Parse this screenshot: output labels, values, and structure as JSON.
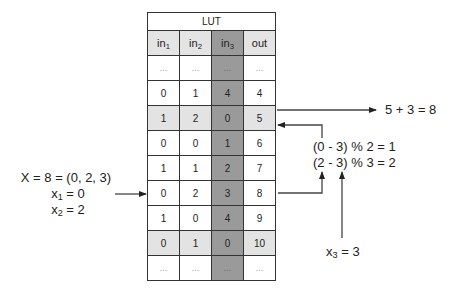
{
  "table": {
    "title": "LUT",
    "columns": [
      {
        "base": "in",
        "sub": "1"
      },
      {
        "base": "in",
        "sub": "2"
      },
      {
        "base": "in",
        "sub": "3"
      },
      {
        "base": "out",
        "sub": ""
      }
    ],
    "shaded_column_index": 2,
    "rows": [
      {
        "cells": [
          "...",
          "...",
          "...",
          "..."
        ],
        "highlight": false
      },
      {
        "cells": [
          "0",
          "1",
          "4",
          "4"
        ],
        "highlight": false
      },
      {
        "cells": [
          "1",
          "2",
          "0",
          "5"
        ],
        "highlight": true
      },
      {
        "cells": [
          "0",
          "0",
          "1",
          "6"
        ],
        "highlight": false
      },
      {
        "cells": [
          "1",
          "1",
          "2",
          "7"
        ],
        "highlight": false
      },
      {
        "cells": [
          "0",
          "2",
          "3",
          "8"
        ],
        "highlight": false
      },
      {
        "cells": [
          "1",
          "0",
          "4",
          "9"
        ],
        "highlight": false
      },
      {
        "cells": [
          "0",
          "1",
          "0",
          "10"
        ],
        "highlight": true
      },
      {
        "cells": [
          "...",
          "...",
          "...",
          "..."
        ],
        "highlight": false
      }
    ]
  },
  "annotations": {
    "input": {
      "line1": "X = 8 = (0, 2, 3)",
      "x1_base": "x",
      "x1_sub": "1",
      "x1_rest": " = 0",
      "x2_base": "x",
      "x2_sub": "2",
      "x2_rest": " = 2"
    },
    "index_calc": {
      "line1": "(0 - 3) % 2 = 1",
      "line2": "(2 - 3) % 3 = 2"
    },
    "x3": {
      "base": "x",
      "sub": "3",
      "rest": " = 3"
    },
    "result": "5 + 3 = 8"
  },
  "colors": {
    "shaded_column": "#9a9a9a",
    "highlight_row": "#e3e3e3",
    "header_row": "#e4e4e4",
    "border": "#333333"
  }
}
